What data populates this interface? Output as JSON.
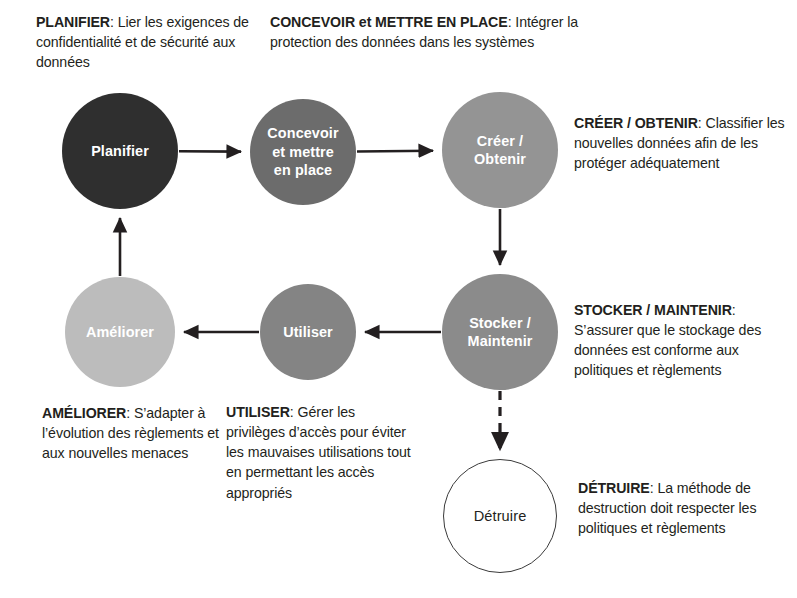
{
  "diagram": {
    "palette": {
      "text": "#231f20",
      "background": "#ffffff",
      "arrow": "#231f20",
      "node_planifier": "#2f2f2f",
      "node_concevoir": "#6c6c6c",
      "node_creer": "#949494",
      "node_stocker": "#8b8b8b",
      "node_utiliser": "#848484",
      "node_ameliorer": "#bcbcbc",
      "node_detruire_fill": "#ffffff",
      "node_detruire_stroke": "#3a3a3a"
    },
    "nodes": [
      {
        "id": "planifier",
        "label": "Planifier",
        "cx": 120,
        "cy": 151,
        "r": 58,
        "fill": "#2f2f2f",
        "label_color": "#ffffff",
        "style": "filled"
      },
      {
        "id": "concevoir",
        "label": "Concevoir\net mettre\nen place",
        "cx": 303,
        "cy": 152,
        "r": 53,
        "fill": "#6c6c6c",
        "label_color": "#ffffff",
        "style": "filled"
      },
      {
        "id": "creer",
        "label": "Créer /\nObtenir",
        "cx": 500,
        "cy": 150,
        "r": 58,
        "fill": "#949494",
        "label_color": "#ffffff",
        "style": "filled"
      },
      {
        "id": "stocker",
        "label": "Stocker /\nMaintenir",
        "cx": 500,
        "cy": 332,
        "r": 58,
        "fill": "#8b8b8b",
        "label_color": "#ffffff",
        "style": "filled"
      },
      {
        "id": "utiliser",
        "label": "Utiliser",
        "cx": 308,
        "cy": 332,
        "r": 48,
        "fill": "#848484",
        "label_color": "#ffffff",
        "style": "filled"
      },
      {
        "id": "ameliorer",
        "label": "Améliorer",
        "cx": 120,
        "cy": 332,
        "r": 55,
        "fill": "#bcbcbc",
        "label_color": "#ffffff",
        "style": "filled"
      },
      {
        "id": "detruire",
        "label": "Détruire",
        "cx": 500,
        "cy": 516,
        "r": 57,
        "fill": "#ffffff",
        "label_color": "#231f20",
        "style": "hollow"
      }
    ],
    "connectors": [
      {
        "id": "planifier-to-concevoir",
        "from": "planifier",
        "to": "concevoir",
        "dashed": false
      },
      {
        "id": "concevoir-to-creer",
        "from": "concevoir",
        "to": "creer",
        "dashed": false
      },
      {
        "id": "creer-to-stocker",
        "from": "creer",
        "to": "stocker",
        "dashed": false
      },
      {
        "id": "stocker-to-utiliser",
        "from": "stocker",
        "to": "utiliser",
        "dashed": false
      },
      {
        "id": "utiliser-to-ameliorer",
        "from": "utiliser",
        "to": "ameliorer",
        "dashed": false
      },
      {
        "id": "ameliorer-to-planifier",
        "from": "ameliorer",
        "to": "planifier",
        "dashed": false
      },
      {
        "id": "stocker-to-detruire",
        "from": "stocker",
        "to": "detruire",
        "dashed": true
      }
    ],
    "annotations": {
      "planifier": {
        "lead": "PLANIFIER",
        "body": ": Lier les exigences de confidentialité et de sécurité aux données"
      },
      "concevoir": {
        "lead": "CONCEVOIR et METTRE EN PLACE",
        "body": ": Intégrer la protection des données dans les systèmes"
      },
      "creer": {
        "lead": "CRÉER / OBTENIR",
        "body": ": Classifier les nouvelles données afin de les protéger adéquatement"
      },
      "stocker": {
        "lead": "STOCKER / MAINTENIR",
        "body": ": S’assurer que le stockage des données est conforme aux politiques et règlements"
      },
      "detruire": {
        "lead": "DÉTRUIRE",
        "body": ": La méthode de destruction doit respecter les politiques et règlements"
      },
      "utiliser": {
        "lead": "UTILISER",
        "body": ": Gérer les privilèges d’accès pour éviter les mauvaises utilisations tout en permettant les accès appropriés"
      },
      "ameliorer": {
        "lead": "AMÉLIORER",
        "body": ": S’adapter à l’évolution des règlements et aux nouvelles menaces"
      }
    }
  }
}
